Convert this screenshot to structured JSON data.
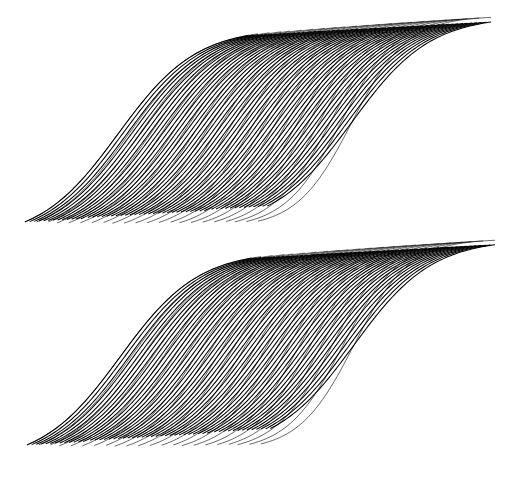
{
  "canvas": {
    "width": 513,
    "height": 484,
    "background_color": "#ffffff",
    "title": "Stacked sigmoid line-bundle op-art"
  },
  "artwork": {
    "type": "line-art",
    "description": "Two vertically stacked bundles of densely packed sigmoid (S-shaped) curves forming woven ribbon bands",
    "stroke_color": "#000000",
    "stroke_width": 1.05,
    "panel_count": 2,
    "lines_per_panel": 52
  },
  "chart_data": {
    "type": "line",
    "xlabel": "",
    "ylabel": "",
    "grid": false,
    "legend": null,
    "xlim": [
      0,
      513
    ],
    "ylim": [
      0,
      484
    ],
    "series_description": "Each series is a logistic sigmoid y = y0 + A / (1 + exp(-k*(x - x0))), drawn with progressively shifted midpoint x0 and baseline y0 to generate the moire ribbon.",
    "panels": [
      {
        "name": "top-panel",
        "index": 0,
        "x_start": 25,
        "x_end": 491,
        "y_top": 15,
        "y_bottom": 241,
        "tip_left": [
          25,
          240
        ],
        "tip_right": [
          491,
          21
        ],
        "line_count": 52,
        "sigmoid": {
          "x0_first": 118,
          "x0_last": 352,
          "steepness_k": 0.0255,
          "amplitude_first": 212,
          "amplitude_last": 212,
          "baseline_first": 240,
          "baseline_last": 228
        }
      },
      {
        "name": "bottom-panel",
        "index": 1,
        "x_start": 27,
        "x_end": 495,
        "y_top": 240,
        "y_bottom": 464,
        "tip_left": [
          27,
          463
        ],
        "tip_right": [
          495,
          244
        ],
        "line_count": 52,
        "sigmoid": {
          "x0_first": 120,
          "x0_last": 354,
          "steepness_k": 0.0255,
          "amplitude_first": 212,
          "amplitude_last": 212,
          "baseline_first": 463,
          "baseline_last": 451
        }
      }
    ]
  }
}
